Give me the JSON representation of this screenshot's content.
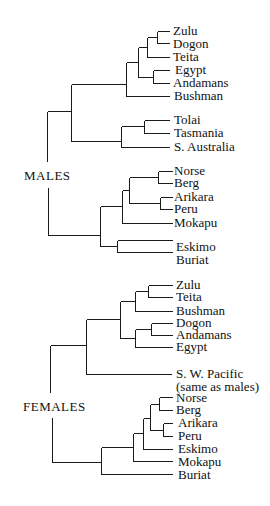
{
  "diagram": {
    "type": "dendrogram",
    "males": {
      "label": "MALES",
      "leaves": [
        "Zulu",
        "Dogon",
        "Teita",
        "Egypt",
        "Andamans",
        "Bushman",
        "Tolai",
        "Tasmania",
        "S. Australia",
        "Norse",
        "Berg",
        "Arikara",
        "Peru",
        "Mokapu",
        "Eskimo",
        "Buriat"
      ]
    },
    "females": {
      "label": "FEMALES",
      "leaves": [
        "Zulu",
        "Teita",
        "Bushman",
        "Dogon",
        "Andamans",
        "Egypt",
        "S. W. Pacific",
        "(same as males)",
        "Norse",
        "Berg",
        "Arikara",
        "Peru",
        "Eskimo",
        "Mokapu",
        "Buriat"
      ]
    }
  }
}
